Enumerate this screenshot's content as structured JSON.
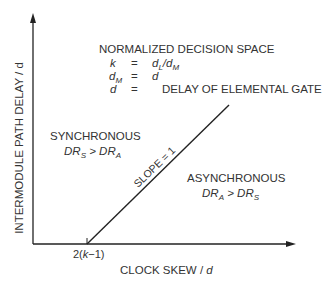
{
  "diagram": {
    "title": "NORMALIZED DECISION SPACE",
    "definitions": [
      {
        "symbol": "k",
        "eq": "=",
        "value_main": "d",
        "value_sub": "L",
        "value_rest": "/d",
        "value_sub2": "M"
      },
      {
        "symbol": "d",
        "symbol_sub": "M",
        "eq": "=",
        "value_main": "d"
      },
      {
        "symbol": "d",
        "eq": "=",
        "value_main": "DELAY OF ELEMENTAL GATE"
      }
    ],
    "y_axis_label": "INTERMODULE PATH DELAY / d",
    "x_axis_label_main": "CLOCK SKEW / ",
    "x_axis_label_var": "d",
    "x_tick_label": "2(k−1)",
    "line_label": "SLOPE = 1",
    "regions": {
      "synchronous": {
        "label": "SYNCHRONOUS",
        "cond_a": "DR",
        "cond_a_sub": "S",
        "op": " > ",
        "cond_b": "DR",
        "cond_b_sub": "A"
      },
      "asynchronous": {
        "label": "ASYNCHRONOUS",
        "cond_a": "DR",
        "cond_a_sub": "A",
        "op": " > ",
        "cond_b": "DR",
        "cond_b_sub": "S"
      }
    },
    "colors": {
      "line": "#222222",
      "text": "#333333",
      "background": "#ffffff"
    }
  }
}
